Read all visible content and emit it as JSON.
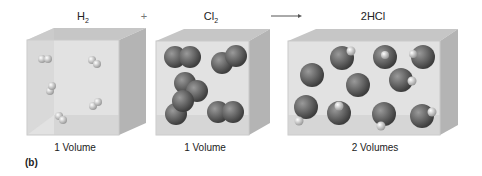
{
  "reaction": {
    "reactant1": {
      "formula": "H",
      "subscript": "2",
      "volume_label": "1 Volume"
    },
    "plus": "+",
    "reactant2": {
      "formula": "Cl",
      "subscript": "2",
      "volume_label": "1 Volume"
    },
    "arrow": "→",
    "product": {
      "formula": "2HCl",
      "volume_label": "2 Volumes"
    }
  },
  "panel_label": "(b)",
  "colors": {
    "box_face": "#dcdcdc",
    "box_side": "#b8b8b8",
    "box_top": "#c8c8c8",
    "cl_atom": "#6a6a6a",
    "h_atom": "#e0e0e0"
  }
}
